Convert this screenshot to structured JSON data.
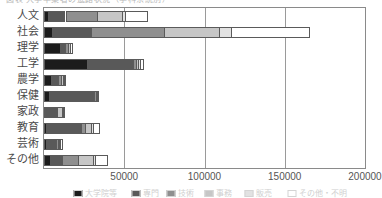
{
  "title": {
    "text": "図表 大学卒業者の進路状況（学科系統別）",
    "visible": "partially-cropped-top"
  },
  "chart_data": {
    "type": "bar",
    "orientation": "horizontal",
    "stacked": true,
    "title": "図表 大学卒業者の進路状況（学科系統別）",
    "xlabel": "",
    "ylabel": "",
    "xlim": [
      0,
      200000
    ],
    "xticks": [
      0,
      50000,
      100000,
      150000,
      200000
    ],
    "xticklabels": [
      "",
      "50000",
      "100000",
      "150000",
      "200000"
    ],
    "grid": "vertical",
    "legend_position": "bottom",
    "categories": [
      "人文",
      "社会",
      "理学",
      "工学",
      "農学",
      "保健",
      "家政",
      "教育",
      "芸術",
      "その他"
    ],
    "series": [
      {
        "name": "大学院等",
        "color": "#1c1c1c",
        "values": [
          2200,
          4800,
          10200,
          26500,
          4400,
          2900,
          600,
          1200,
          1300,
          3600
        ]
      },
      {
        "name": "専門",
        "color": "#595959",
        "values": [
          11200,
          24400,
          3100,
          28800,
          4300,
          28500,
          6700,
          21800,
          6000,
          7800
        ]
      },
      {
        "name": "技術",
        "color": "#8f8f8f",
        "values": [
          19900,
          45300,
          1500,
          1900,
          1900,
          700,
          900,
          2500,
          1200,
          9800
        ]
      },
      {
        "name": "事務",
        "color": "#c6c6c6",
        "values": [
          15100,
          34800,
          1100,
          1500,
          1200,
          500,
          3100,
          3900,
          1000,
          9300
        ]
      },
      {
        "name": "販売",
        "color": "#e2e2e2",
        "values": [
          1900,
          7200,
          600,
          900,
          800,
          300,
          700,
          900,
          600,
          1200
        ]
      },
      {
        "name": "その他・不明",
        "color": "#ffffff",
        "values": [
          14500,
          49500,
          1300,
          2500,
          1100,
          400,
          1200,
          4500,
          1700,
          8300
        ]
      }
    ],
    "totals": [
      64800,
      166000,
      17800,
      62100,
      13700,
      33300,
      13200,
      34800,
      11800,
      40000
    ]
  },
  "axis": {
    "ticklabels": [
      {
        "value": 50000,
        "label": "50000"
      },
      {
        "value": 100000,
        "label": "100000"
      },
      {
        "value": 150000,
        "label": "150000"
      },
      {
        "value": 200000,
        "label": "200000"
      }
    ]
  },
  "legend": {
    "cropped": true,
    "items": [
      {
        "label": "大学院等",
        "color": "#1c1c1c"
      },
      {
        "label": "専門",
        "color": "#595959"
      },
      {
        "label": "技術",
        "color": "#8f8f8f"
      },
      {
        "label": "事務",
        "color": "#c6c6c6"
      },
      {
        "label": "販売",
        "color": "#e2e2e2"
      },
      {
        "label": "その他・不明",
        "color": "#ffffff"
      }
    ]
  }
}
